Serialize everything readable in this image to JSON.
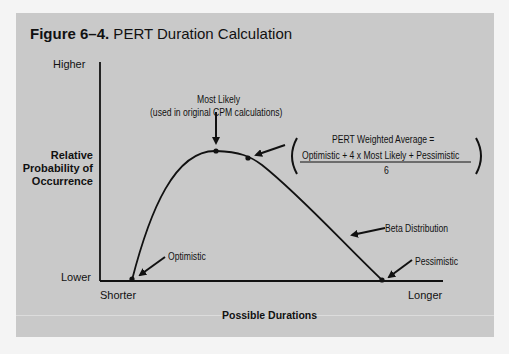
{
  "figure": {
    "title_prefix": "Figure 6–4.",
    "title_text": " PERT Duration Calculation"
  },
  "y_axis": {
    "label_line1": "Relative",
    "label_line2": "Probability of",
    "label_line3": "Occurrence",
    "top_label": "Higher",
    "bottom_label": "Lower"
  },
  "x_axis": {
    "label": "Possible Durations",
    "left_label": "Shorter",
    "right_label": "Longer"
  },
  "annotations": {
    "most_likely": "Most Likely",
    "most_likely_note": "(used in original CPM calculations)",
    "optimistic": "Optimistic",
    "pessimistic": "Pessimistic",
    "beta": "Beta Distribution"
  },
  "formula": {
    "lhs": "PERT Weighted Average =",
    "numerator": "Optimistic + 4 x Most Likely + Pessimistic",
    "denominator": "6"
  },
  "colors": {
    "panel": "#c9c9c9",
    "ink": "#111111"
  }
}
